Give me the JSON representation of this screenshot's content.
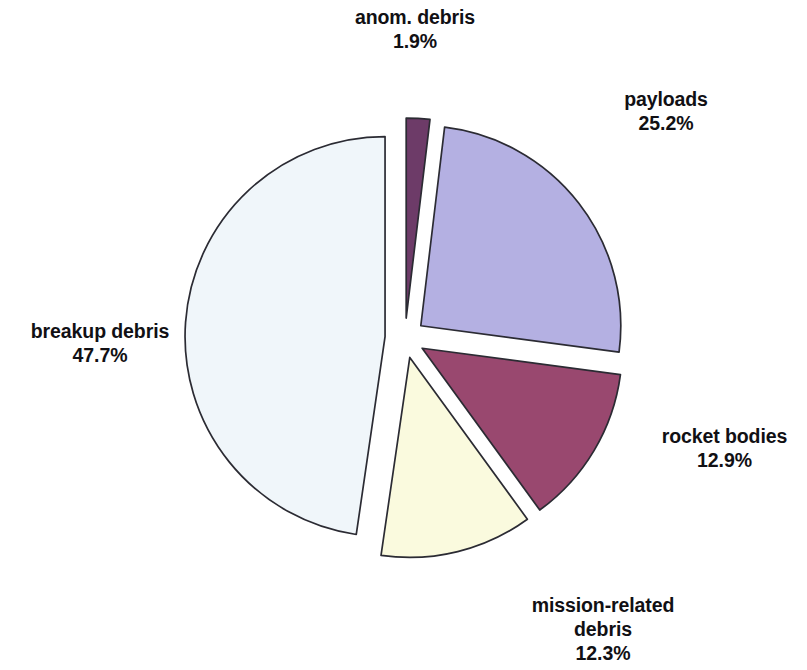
{
  "figure": {
    "background_color": "#ffffff",
    "outline_color": "#2b2b33"
  },
  "chart_data": {
    "type": "pie",
    "title": "",
    "subtitle": "",
    "xlabel": "",
    "ylabel": "",
    "legend_position": "none",
    "grid": false,
    "exploded": true,
    "start_angle_deg": 0,
    "direction": "clockwise",
    "categories": [
      "anom. debris",
      "payloads",
      "rocket bodies",
      "mission-related debris",
      "breakup debris"
    ],
    "values": [
      1.9,
      25.2,
      12.9,
      12.3,
      47.7
    ],
    "value_labels": [
      "1.9%",
      "25.2%",
      "12.9%",
      "12.3%",
      "47.7%"
    ],
    "units": "percent",
    "total": 100.0,
    "colors": [
      "#6d3b68",
      "#b4b0e2",
      "#99486f",
      "#fafade",
      "#f0f6fa"
    ],
    "slices": [
      {
        "label": "anom. debris",
        "label_line1": "anom. debris",
        "label_line2": "1.9%",
        "value": 1.9,
        "percent_text": "1.9%",
        "color": "#6d3b68",
        "start_angle_deg": 0.0,
        "end_angle_deg": 6.84,
        "explode": 0.1
      },
      {
        "label": "payloads",
        "label_line1": "payloads",
        "label_line2": "25.2%",
        "value": 25.2,
        "percent_text": "25.2%",
        "color": "#b4b0e2",
        "start_angle_deg": 6.84,
        "end_angle_deg": 97.56,
        "explode": 0.1
      },
      {
        "label": "rocket bodies",
        "label_line1": "rocket bodies",
        "label_line2": "12.9%",
        "value": 12.9,
        "percent_text": "12.9%",
        "color": "#99486f",
        "start_angle_deg": 97.56,
        "end_angle_deg": 143.99,
        "explode": 0.1
      },
      {
        "label": "mission-related debris",
        "label_line1": "mission-related",
        "label_line2": "debris",
        "label_line3": "12.3%",
        "value": 12.3,
        "percent_text": "12.3%",
        "color": "#fafade",
        "start_angle_deg": 143.99,
        "end_angle_deg": 188.27,
        "explode": 0.1
      },
      {
        "label": "breakup debris",
        "label_line1": "breakup debris",
        "label_line2": "47.7%",
        "value": 47.7,
        "percent_text": "47.7%",
        "color": "#f0f6fa",
        "start_angle_deg": 188.27,
        "end_angle_deg": 360.0,
        "explode": 0.1
      }
    ]
  }
}
